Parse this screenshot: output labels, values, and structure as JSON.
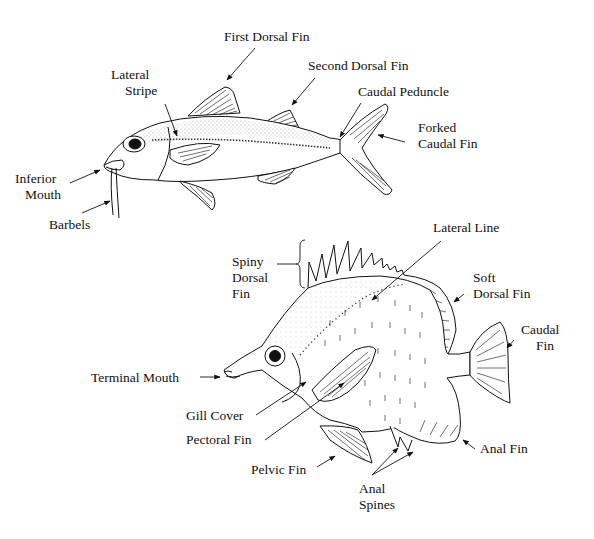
{
  "diagram": {
    "type": "fish-anatomy",
    "ink_color": "#111111",
    "background": "#ffffff",
    "fish_top": {
      "name": "goatfish-style fish",
      "labels": {
        "first_dorsal_fin": "First Dorsal Fin",
        "second_dorsal_fin": "Second Dorsal Fin",
        "lateral_stripe_1": "Lateral",
        "lateral_stripe_2": "Stripe",
        "caudal_peduncle": "Caudal Peduncle",
        "forked_caudal_fin_1": "Forked",
        "forked_caudal_fin_2": "Caudal Fin",
        "inferior_mouth_1": "Inferior",
        "inferior_mouth_2": "Mouth",
        "barbels": "Barbels"
      }
    },
    "fish_bottom": {
      "name": "butterflyfish-style fish",
      "labels": {
        "lateral_line": "Lateral Line",
        "spiny_dorsal_fin_1": "Spiny",
        "spiny_dorsal_fin_2": "Dorsal",
        "spiny_dorsal_fin_3": "Fin",
        "soft_dorsal_fin_1": "Soft",
        "soft_dorsal_fin_2": "Dorsal Fin",
        "caudal_fin_1": "Caudal",
        "caudal_fin_2": "Fin",
        "terminal_mouth": "Terminal Mouth",
        "gill_cover": "Gill Cover",
        "pectoral_fin": "Pectoral Fin",
        "pelvic_fin": "Pelvic Fin",
        "anal_fin": "Anal Fin",
        "anal_spines_1": "Anal",
        "anal_spines_2": "Spines"
      }
    }
  }
}
